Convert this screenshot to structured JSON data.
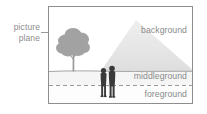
{
  "diagram": {
    "annotation": {
      "line1": "picture",
      "line2": "plane"
    },
    "labels": {
      "background": "background",
      "middleground": "middleground",
      "foreground": "foreground"
    },
    "elements": {
      "mountain": "mountain-shape",
      "tree": "tree-shape",
      "figures": "two-person-silhouettes",
      "horizon": "horizon-line",
      "divider": "dashed-divider-line",
      "frame": "picture-plane-frame",
      "leader": "leader-dash"
    },
    "colors": {
      "frame_border": "#8e8e8e",
      "mountain_fill": "#e8e8e8",
      "tree_fill": "#a0a0a0",
      "figure_fill": "#3a3a3a",
      "label_text": "#8a8a8a",
      "annotation_text": "#8d8d8d",
      "horizon_line": "#9b9b9b",
      "dashed_line": "#8f8f8f",
      "middleground_fill": "#f4f4f4",
      "foreground_fill": "#fdfdfd",
      "sky_fill": "#ffffff"
    }
  }
}
